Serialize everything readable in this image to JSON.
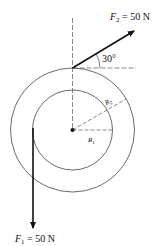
{
  "diagram": {
    "forces": {
      "f1": {
        "symbol": "F",
        "subscript": "1",
        "value_text": " = 50 N",
        "direction": "down"
      },
      "f2": {
        "symbol": "F",
        "subscript": "2",
        "value_text": " = 50 N",
        "angle_label": "30°"
      }
    },
    "radii": {
      "r1": {
        "symbol": "R",
        "subscript": "1"
      },
      "r2": {
        "symbol": "R",
        "subscript": "2"
      }
    },
    "colors": {
      "line": "#111111",
      "thin": "#444444",
      "dashed": "#555555"
    }
  }
}
